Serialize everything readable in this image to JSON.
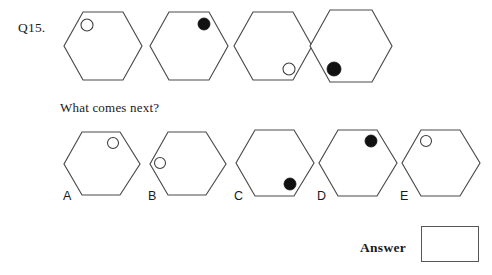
{
  "question": {
    "number_label": "Q15.",
    "prompt": "What comes next?"
  },
  "sequence": {
    "items": [
      {
        "position": 1,
        "shape": "hexagon",
        "marker": "open-circle",
        "marker_location": "top-left"
      },
      {
        "position": 2,
        "shape": "hexagon",
        "marker": "filled-circle",
        "marker_location": "top-right"
      },
      {
        "position": 3,
        "shape": "hexagon",
        "marker": "open-circle",
        "marker_location": "bottom-right"
      },
      {
        "position": 4,
        "shape": "hexagon",
        "marker": "filled-circle",
        "marker_location": "bottom-left"
      }
    ]
  },
  "options": {
    "items": [
      {
        "label": "A",
        "shape": "hexagon",
        "marker": "open-circle",
        "marker_location": "top-right"
      },
      {
        "label": "B",
        "shape": "hexagon",
        "marker": "open-circle",
        "marker_location": "middle-left"
      },
      {
        "label": "C",
        "shape": "hexagon",
        "marker": "filled-circle",
        "marker_location": "bottom-right"
      },
      {
        "label": "D",
        "shape": "hexagon",
        "marker": "filled-circle",
        "marker_location": "top-right"
      },
      {
        "label": "E",
        "shape": "hexagon",
        "marker": "open-circle",
        "marker_location": "top-left"
      }
    ]
  },
  "answer": {
    "label": "Answer",
    "value": ""
  },
  "colors": {
    "page_background": "#ffffff",
    "outline": "#4a4a4a",
    "filled_marker": "#111111",
    "open_marker_stroke": "#3c3c3c",
    "text": "#1a1a1a",
    "answer_box_border": "#555555"
  }
}
